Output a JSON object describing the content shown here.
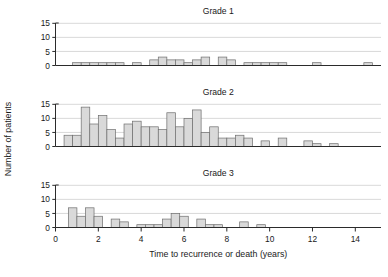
{
  "figure": {
    "ylabel": "Number of patients",
    "xlabel": "Time to recurrence or death (years)",
    "bar_fill": "#d9d9d9",
    "bar_stroke": "#6e6e6e",
    "grid_color": "#c9c9c9",
    "axis_color": "#2b2b2b",
    "background": "#ffffff"
  },
  "chart_data": [
    {
      "type": "bar",
      "title": "Grade 1",
      "xlabel": "",
      "ylabel": "Number of patients",
      "xlim": [
        0,
        15.2
      ],
      "ylim": [
        0,
        16
      ],
      "yticks": [
        0,
        5,
        10,
        15
      ],
      "xticks": [
        0,
        2,
        4,
        6,
        8,
        10,
        12,
        14
      ],
      "grid": true,
      "bin_width": 0.4,
      "bin_starts": [
        0.8,
        1.2,
        1.6,
        2.0,
        2.4,
        2.8,
        3.6,
        4.4,
        4.8,
        5.2,
        5.6,
        6.0,
        6.4,
        6.8,
        7.6,
        8.0,
        8.8,
        9.2,
        9.6,
        10.0,
        10.4,
        12.0,
        14.4
      ],
      "values": [
        1,
        1,
        1,
        1,
        1,
        1,
        1,
        2,
        3,
        2,
        2,
        1,
        2,
        3,
        3,
        2,
        1,
        1,
        1,
        1,
        1,
        1,
        1
      ]
    },
    {
      "type": "bar",
      "title": "Grade 2",
      "xlabel": "",
      "ylabel": "Number of patients",
      "xlim": [
        0,
        15.2
      ],
      "ylim": [
        0,
        16
      ],
      "yticks": [
        0,
        5,
        10,
        15
      ],
      "xticks": [
        0,
        2,
        4,
        6,
        8,
        10,
        12,
        14
      ],
      "grid": true,
      "bin_width": 0.4,
      "bin_starts": [
        0.4,
        0.8,
        1.2,
        1.6,
        2.0,
        2.4,
        2.8,
        3.2,
        3.6,
        4.0,
        4.4,
        4.8,
        5.2,
        5.6,
        6.0,
        6.4,
        6.8,
        7.2,
        7.6,
        8.0,
        8.4,
        8.8,
        9.6,
        10.4,
        11.6,
        12.0,
        12.8
      ],
      "values": [
        4,
        4,
        14,
        8,
        11,
        6,
        3,
        8,
        9,
        7,
        7,
        6,
        12,
        7,
        10,
        13,
        5,
        7,
        3,
        3,
        4,
        3,
        2,
        3,
        2,
        1,
        1
      ]
    },
    {
      "type": "bar",
      "title": "Grade 3",
      "xlabel": "Time to recurrence or death (years)",
      "ylabel": "Number of patients",
      "xlim": [
        0,
        15.2
      ],
      "ylim": [
        0,
        16
      ],
      "yticks": [
        0,
        5,
        10,
        15
      ],
      "xticks": [
        0,
        2,
        4,
        6,
        8,
        10,
        12,
        14
      ],
      "grid": true,
      "bin_width": 0.4,
      "bin_starts": [
        0.6,
        1.0,
        1.4,
        1.8,
        2.6,
        3.0,
        3.8,
        4.2,
        4.6,
        5.0,
        5.4,
        5.8,
        6.6,
        7.0,
        7.4,
        8.6,
        9.4
      ],
      "values": [
        7,
        4,
        7,
        4,
        3,
        2,
        1,
        1,
        1,
        3,
        5,
        4,
        3,
        1,
        1,
        2,
        1
      ]
    }
  ]
}
